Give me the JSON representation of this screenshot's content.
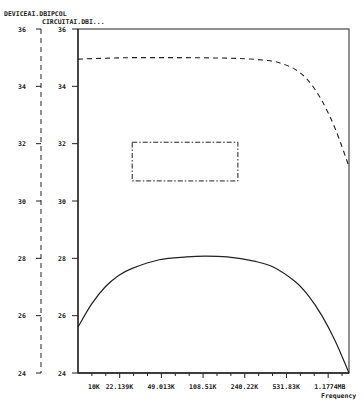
{
  "chart_data": {
    "type": "line",
    "title": "",
    "trace_labels": [
      "DEVICEAI.DBIPCOL",
      "CIRCUITAI.DBI..."
    ],
    "xlabel": "Frequency",
    "ylabel": "",
    "x_scale": "log",
    "x_ticks": [
      "10K",
      "22.139K",
      "49.013K",
      "108.51K",
      "240.22K",
      "531.83K",
      "1.1774MB"
    ],
    "y_ticks_left": [
      "36",
      "34",
      "32",
      "30",
      "28",
      "26",
      "24"
    ],
    "y_ticks_inner": [
      "36",
      "34",
      "32",
      "30",
      "28",
      "26",
      "24"
    ],
    "ylim": [
      24,
      36
    ],
    "grid": false,
    "series": [
      {
        "name": "DEVICEAI.DBIPCOL",
        "style": "dashed",
        "x_frac": [
          0.0,
          0.1,
          0.2,
          0.3,
          0.4,
          0.5,
          0.6,
          0.7,
          0.75,
          0.8,
          0.85,
          0.9,
          0.95,
          1.0
        ],
        "values": [
          34.95,
          34.98,
          35.0,
          35.0,
          35.0,
          34.99,
          34.97,
          34.9,
          34.8,
          34.6,
          34.2,
          33.5,
          32.5,
          31.2
        ]
      },
      {
        "name": "CIRCUITAI.DBI...",
        "style": "solid",
        "x_frac": [
          0.0,
          0.05,
          0.1,
          0.15,
          0.2,
          0.3,
          0.4,
          0.47,
          0.55,
          0.65,
          0.72,
          0.8,
          0.85,
          0.9,
          0.95,
          1.0
        ],
        "values": [
          25.6,
          26.4,
          27.0,
          27.4,
          27.65,
          27.95,
          28.05,
          28.08,
          28.05,
          27.9,
          27.7,
          27.2,
          26.7,
          26.0,
          25.1,
          24.0
        ]
      }
    ],
    "annotations": [
      {
        "type": "dash-dot-rectangle",
        "x_frac": [
          0.2,
          0.59
        ],
        "y": [
          30.7,
          32.05
        ]
      }
    ]
  }
}
